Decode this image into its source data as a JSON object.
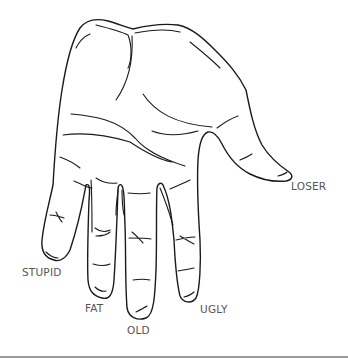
{
  "figure": {
    "line_color": "#1a1a1a",
    "label_color": "#555555",
    "background": "#ffffff",
    "rule_color": "#9a9a9a"
  },
  "labels": {
    "thumb": "LOSER",
    "index": "STUPID",
    "middle": "FAT",
    "ring": "OLD",
    "pinky": "UGLY"
  }
}
